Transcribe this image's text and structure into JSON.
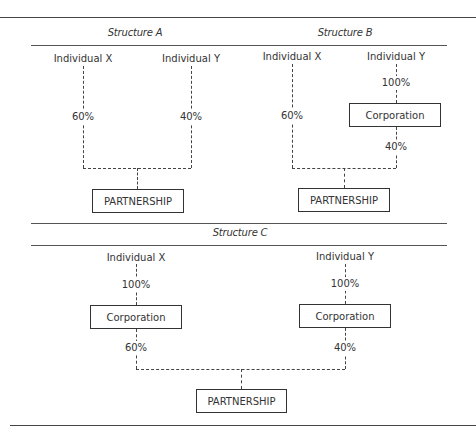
{
  "structures": {
    "a": {
      "title": "Structure A",
      "individual_x": "Individual X",
      "individual_y": "Individual Y",
      "x_pct": "60%",
      "y_pct": "40%",
      "partnership": "PARTNERSHIP"
    },
    "b": {
      "title": "Structure B",
      "individual_x": "Individual X",
      "individual_y": "Individual Y",
      "y_to_corp_pct": "100%",
      "corporation": "Corporation",
      "x_pct": "60%",
      "corp_pct": "40%",
      "partnership": "PARTNERSHIP"
    },
    "c": {
      "title": "Structure C",
      "individual_x": "Individual X",
      "individual_y": "Individual Y",
      "x_to_corp_pct": "100%",
      "y_to_corp_pct": "100%",
      "corporation_left": "Corporation",
      "corporation_right": "Corporation",
      "corp_left_pct": "60%",
      "corp_right_pct": "40%",
      "partnership": "PARTNERSHIP"
    }
  }
}
